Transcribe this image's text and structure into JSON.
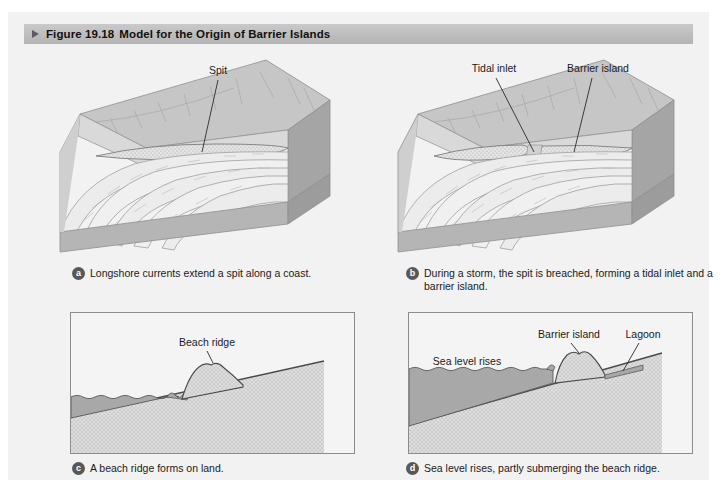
{
  "figure": {
    "number": "Figure 19.18",
    "title": "Model for the Origin of Barrier Islands",
    "marker_icon": "triangle-right-icon"
  },
  "colors": {
    "header_bar": "#bdbdbd",
    "page_background": "#f2f2f2",
    "panel_border": "#8c8c8c",
    "water": "#a8a8a8",
    "sand": "#dcdcdc",
    "land": "#cfcfcf",
    "badge": "#58585a",
    "text": "#1a1a1a"
  },
  "panels": [
    {
      "id": "a",
      "badge": "a",
      "caption": "Longshore currents extend a spit along a coast.",
      "type": "block-diagram",
      "labels": [
        {
          "name": "spit-label",
          "text": "Spit"
        }
      ]
    },
    {
      "id": "b",
      "badge": "b",
      "caption": "During a storm, the spit is breached, forming a tidal inlet and a barrier island.",
      "caption_line1": "During a storm, the spit is breached, forming a tidal",
      "caption_line2": "inlet and a barrier island.",
      "type": "block-diagram",
      "labels": [
        {
          "name": "tidal-inlet-label",
          "text": "Tidal inlet"
        },
        {
          "name": "barrier-island-label",
          "text": "Barrier island"
        }
      ]
    },
    {
      "id": "c",
      "badge": "c",
      "caption": "A beach ridge forms on land.",
      "type": "cross-section",
      "labels": [
        {
          "name": "beach-ridge-label",
          "text": "Beach ridge"
        }
      ]
    },
    {
      "id": "d",
      "badge": "d",
      "caption": "Sea level rises, partly submerging the beach ridge.",
      "type": "cross-section",
      "labels": [
        {
          "name": "sea-level-rises-label",
          "text": "Sea level rises"
        },
        {
          "name": "barrier-island-label",
          "text": "Barrier island"
        },
        {
          "name": "lagoon-label",
          "text": "Lagoon"
        }
      ]
    }
  ]
}
